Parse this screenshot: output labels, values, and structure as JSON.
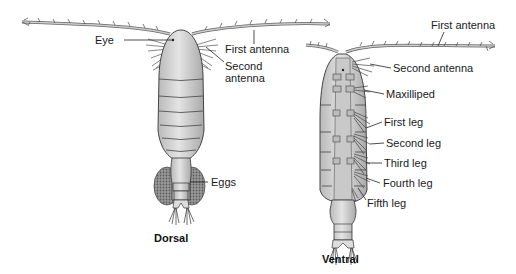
{
  "figure": {
    "dorsal": {
      "caption": "Dorsal",
      "labels": {
        "eye": "Eye",
        "first_antenna": "First antenna",
        "second_antenna_line1": "Second",
        "second_antenna_line2": "antenna",
        "eggs": "Eggs"
      }
    },
    "ventral": {
      "caption": "Ventral",
      "labels": {
        "first_antenna": "First antenna",
        "second_antenna": "Second antenna",
        "maxilliped": "Maxilliped",
        "first_leg": "First leg",
        "second_leg": "Second leg",
        "third_leg": "Third leg",
        "fourth_leg": "Fourth leg",
        "fifth_leg": "Fifth leg"
      }
    },
    "colors": {
      "body_fill": "#d6d6d6",
      "body_shade": "#a8a8a8",
      "outline": "#333333",
      "egg_fill": "#8a8a8a",
      "leader_line": "#222222"
    }
  }
}
